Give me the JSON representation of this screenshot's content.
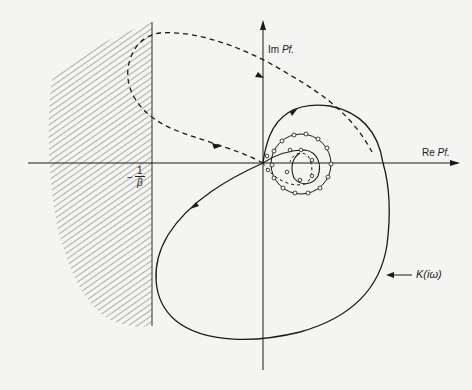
{
  "diagram": {
    "type": "nyquist-plot",
    "axes": {
      "imag_label_prefix": "Im",
      "imag_label_var": "Pf.",
      "real_label_prefix": "Re",
      "real_label_var": "Pf."
    },
    "critical_point": {
      "sign": "−",
      "numerator": "1",
      "denominator": "β"
    },
    "curve_label": "K(iω)",
    "colors": {
      "background": "#f4f4f2",
      "ink": "#1a1a1a",
      "hatch": "#555555"
    }
  }
}
